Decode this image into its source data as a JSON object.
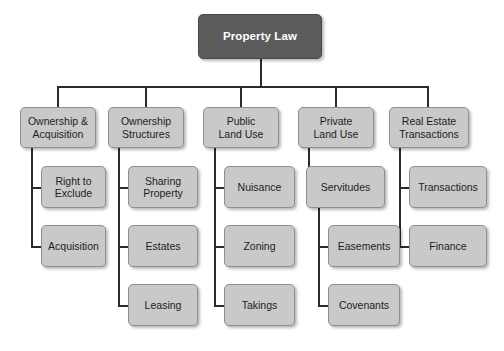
{
  "diagram": {
    "title": "Property Law",
    "type": "hierarchy-tree",
    "colors": {
      "root_fill": "#5b5b5b",
      "root_text": "#ffffff",
      "node_fill": "#c9c9c9",
      "node_border": "#8f8f8f",
      "node_text": "#1d1d1d",
      "connector": "#2b2b2b",
      "background": "#ffffff"
    },
    "root": {
      "label": "Property Law"
    },
    "branches": [
      {
        "label": "Ownership &\nAcquisition",
        "line1": "Ownership &",
        "line2": "Acquisition",
        "children": [
          {
            "label": "Right to\nExclude",
            "line1": "Right to",
            "line2": "Exclude"
          },
          {
            "label": "Acquisition",
            "line1": "Acquisition",
            "line2": ""
          }
        ]
      },
      {
        "label": "Ownership\nStructures",
        "line1": "Ownership",
        "line2": "Structures",
        "children": [
          {
            "label": "Sharing\nProperty",
            "line1": "Sharing",
            "line2": "Property"
          },
          {
            "label": "Estates",
            "line1": "Estates",
            "line2": ""
          },
          {
            "label": "Leasing",
            "line1": "Leasing",
            "line2": ""
          }
        ]
      },
      {
        "label": "Public\nLand Use",
        "line1": "Public",
        "line2": "Land Use",
        "children": [
          {
            "label": "Nuisance",
            "line1": "Nuisance",
            "line2": ""
          },
          {
            "label": "Zoning",
            "line1": "Zoning",
            "line2": ""
          },
          {
            "label": "Takings",
            "line1": "Takings",
            "line2": ""
          }
        ]
      },
      {
        "label": "Private\nLand Use",
        "line1": "Private",
        "line2": "Land Use",
        "children": [
          {
            "label": "Servitudes",
            "line1": "Servitudes",
            "line2": "",
            "children": [
              {
                "label": "Easements",
                "line1": "Easements",
                "line2": ""
              },
              {
                "label": "Covenants",
                "line1": "Covenants",
                "line2": ""
              }
            ]
          }
        ]
      },
      {
        "label": "Real Estate\nTransactions",
        "line1": "Real Estate",
        "line2": "Transactions",
        "children": [
          {
            "label": "Transactions",
            "line1": "Transactions",
            "line2": ""
          },
          {
            "label": "Finance",
            "line1": "Finance",
            "line2": ""
          }
        ]
      }
    ]
  }
}
